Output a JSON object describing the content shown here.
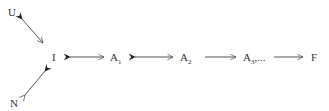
{
  "diagram": {
    "type": "flow",
    "colors": {
      "ink": "#333333",
      "background": "#ffffff"
    },
    "nodes": [
      {
        "id": "U",
        "label": "U",
        "subscript": ""
      },
      {
        "id": "N",
        "label": "N",
        "subscript": ""
      },
      {
        "id": "I",
        "label": "I",
        "subscript": ""
      },
      {
        "id": "A1",
        "label": "A",
        "subscript": "1"
      },
      {
        "id": "A2",
        "label": "A",
        "subscript": "2"
      },
      {
        "id": "A3",
        "label": "A",
        "subscript": "3",
        "suffix": ",..."
      },
      {
        "id": "F",
        "label": "F",
        "subscript": ""
      }
    ],
    "edges": [
      {
        "from": "I",
        "to": "U",
        "style": "bidirectional",
        "filled_head": "U"
      },
      {
        "from": "N",
        "to": "I",
        "style": "bidirectional",
        "filled_head": "I"
      },
      {
        "from": "I",
        "to": "A1",
        "style": "bidirectional",
        "filled_head": "I"
      },
      {
        "from": "A1",
        "to": "A2",
        "style": "bidirectional",
        "filled_head": "A1"
      },
      {
        "from": "A2",
        "to": "A3",
        "style": "directed"
      },
      {
        "from": "A3",
        "to": "F",
        "style": "directed"
      }
    ]
  }
}
